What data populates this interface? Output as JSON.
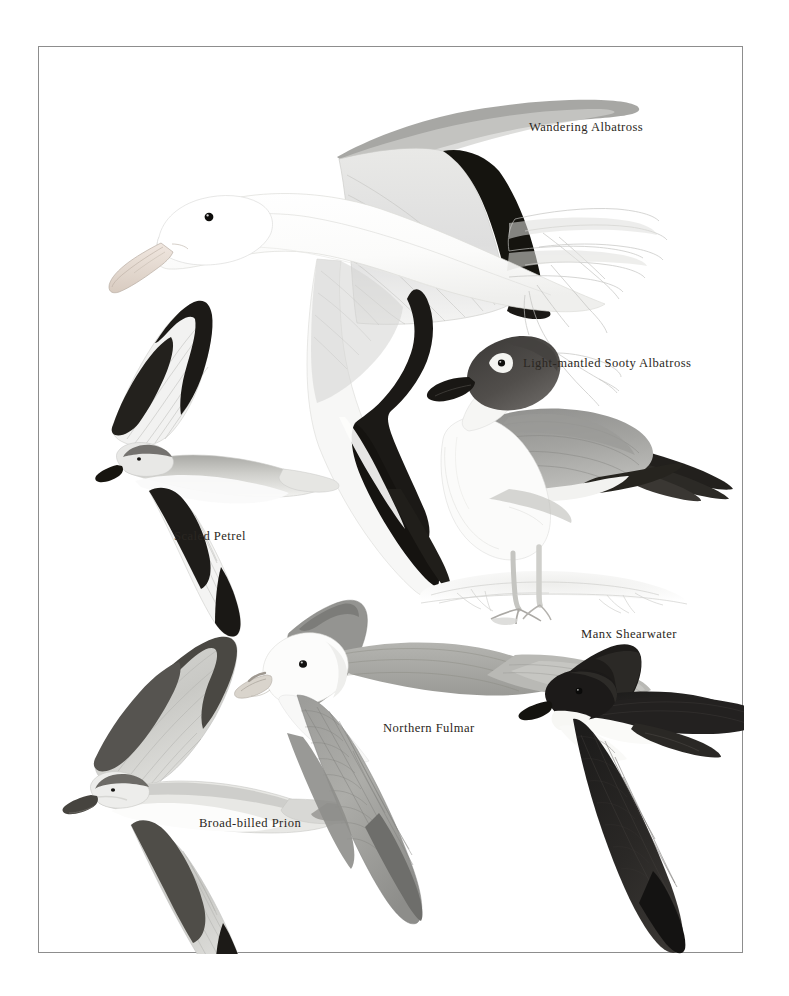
{
  "plate": {
    "kind": "field-guide-illustration-plate",
    "subject": "seabirds",
    "background_color": "#ffffff",
    "border_color": "#8d8d8d",
    "ink_color": "#2b2722"
  },
  "labels": {
    "wandering_albatross": "Wandering Albatross",
    "light_mantled_sooty_albatross": "Light-mantled Sooty Albatross",
    "scaled_petrel": "Scaled Petrel",
    "manx_shearwater": "Manx Shearwater",
    "northern_fulmar": "Northern Fulmar",
    "broad_billed_prion": "Broad-billed Prion"
  },
  "figures": [
    {
      "name": "wandering-albatross",
      "label": "Wandering Albatross",
      "pose": "in flight, banking, seen from side",
      "plumage": "white body and head, white wings with black trailing edge and black wing-tips, pale pink bill",
      "position": "top-centre"
    },
    {
      "name": "light-mantled-sooty-albatross",
      "label": "Light-mantled Sooty Albatross",
      "pose": "standing on snow/rock",
      "plumage": "dark sooty-brown hood, white eye-crescent, pale grey mantle, whitish breast, long dark tail, black bill",
      "position": "middle-right"
    },
    {
      "name": "scaled-petrel",
      "label": "Scaled Petrel",
      "pose": "in flight, underwing view",
      "plumage": "grey upperparts, white underparts, bold black M-bar across underwings, dark cap",
      "position": "middle-left"
    },
    {
      "name": "manx-shearwater",
      "label": "Manx Shearwater",
      "pose": "in flight, upperwing view",
      "plumage": "blackish-brown above, white below and on throat, sharply demarcated",
      "position": "bottom-right"
    },
    {
      "name": "northern-fulmar",
      "label": "Northern Fulmar",
      "pose": "in flight, upperwing view",
      "plumage": "white head and underparts, grey mantle and wings, pale primary patch, stubby tube-nosed bill",
      "position": "bottom-centre"
    },
    {
      "name": "broad-billed-prion",
      "label": "Broad-billed Prion",
      "pose": "in flight, upperwing view",
      "plumage": "blue-grey above with dark M-bar, white below, broad dark-tipped tail, broad blue bill",
      "position": "bottom-left"
    }
  ]
}
